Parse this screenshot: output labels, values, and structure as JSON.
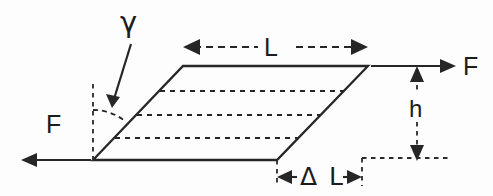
{
  "figure": {
    "type": "engineering-diagram",
    "background_color": "#fdfdfd",
    "line_color": "#262626",
    "labels": {
      "shear_angle": "γ",
      "length": "L",
      "force_right": "F",
      "force_left": "F",
      "height": "h",
      "displacement": "Δ L"
    },
    "elements": {
      "body_shape": "parallelogram",
      "internal_lines_count": 3,
      "internal_line_style": "dashed",
      "shear_arc": "dashed-arc",
      "gamma_pointer": "arrow",
      "force_arrow_top": "arrow-right-solid",
      "force_arrow_bottom": "arrow-left-solid",
      "length_dimension": "double-arrow-dashed-horizontal",
      "height_dimension": "double-arrow-dashed-vertical",
      "displacement_dimension": "double-arrow-inward-horizontal"
    },
    "geometry": {
      "bottom_left": [
        93,
        160
      ],
      "bottom_right": [
        277,
        160
      ],
      "top_left": [
        183,
        66
      ],
      "top_right": [
        368,
        66
      ],
      "shear_offset_px": 90
    }
  }
}
